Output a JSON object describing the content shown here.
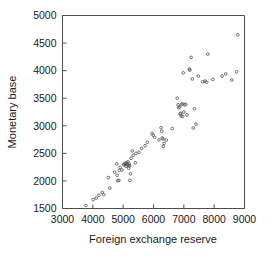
{
  "chart_data": {
    "type": "scatter",
    "title": "",
    "xlabel": "Foreign exchange reserve",
    "ylabel": "Monetary base",
    "xlim": [
      3000,
      9000
    ],
    "ylim": [
      1500,
      5000
    ],
    "xticks": [
      3000,
      4000,
      5000,
      6000,
      7000,
      8000,
      9000
    ],
    "yticks": [
      1500,
      2000,
      2500,
      3000,
      3500,
      4000,
      4500,
      5000
    ],
    "xtick_labels": [
      "3000",
      "4000",
      "5000",
      "6000",
      "7000",
      "8000",
      "9000"
    ],
    "ytick_labels": [
      "1500",
      "2000",
      "2500",
      "3000",
      "3500",
      "4000",
      "4500",
      "5000"
    ],
    "grid": false,
    "legend": null,
    "marker": "open-circle",
    "marker_color": "#5a5a5a",
    "series": [
      {
        "name": "observations",
        "points": [
          [
            3770,
            1555
          ],
          [
            4010,
            1660
          ],
          [
            4110,
            1690
          ],
          [
            4200,
            1740
          ],
          [
            4310,
            1790
          ],
          [
            4360,
            1750
          ],
          [
            4510,
            2060
          ],
          [
            4560,
            1870
          ],
          [
            4720,
            2160
          ],
          [
            4790,
            2310
          ],
          [
            4800,
            2100
          ],
          [
            4820,
            2005
          ],
          [
            4860,
            2010
          ],
          [
            4870,
            2190
          ],
          [
            4900,
            2245
          ],
          [
            4960,
            2200
          ],
          [
            5010,
            2300
          ],
          [
            5040,
            2290
          ],
          [
            5060,
            2320
          ],
          [
            5080,
            2300
          ],
          [
            5090,
            2265
          ],
          [
            5110,
            2330
          ],
          [
            5130,
            2310
          ],
          [
            5150,
            2295
          ],
          [
            5160,
            2345
          ],
          [
            5170,
            2280
          ],
          [
            5180,
            2230
          ],
          [
            5200,
            2305
          ],
          [
            5210,
            2270
          ],
          [
            5220,
            2010
          ],
          [
            5240,
            2130
          ],
          [
            5260,
            2410
          ],
          [
            5300,
            2545
          ],
          [
            5330,
            2465
          ],
          [
            5400,
            2330
          ],
          [
            5420,
            2500
          ],
          [
            5520,
            2520
          ],
          [
            5610,
            2590
          ],
          [
            5720,
            2640
          ],
          [
            5800,
            2700
          ],
          [
            5950,
            2860
          ],
          [
            5990,
            2830
          ],
          [
            6040,
            2790
          ],
          [
            6180,
            2745
          ],
          [
            6250,
            2965
          ],
          [
            6270,
            2900
          ],
          [
            6290,
            2780
          ],
          [
            6310,
            2760
          ],
          [
            6320,
            2625
          ],
          [
            6350,
            2680
          ],
          [
            6420,
            2740
          ],
          [
            6620,
            2950
          ],
          [
            6780,
            3500
          ],
          [
            6810,
            3380
          ],
          [
            6830,
            3330
          ],
          [
            6860,
            3340
          ],
          [
            6880,
            3215
          ],
          [
            6900,
            3225
          ],
          [
            6910,
            3180
          ],
          [
            6930,
            3385
          ],
          [
            6950,
            3400
          ],
          [
            6960,
            3170
          ],
          [
            6980,
            3960
          ],
          [
            7000,
            3250
          ],
          [
            7030,
            3380
          ],
          [
            7060,
            3390
          ],
          [
            7100,
            3200
          ],
          [
            7180,
            4030
          ],
          [
            7200,
            4010
          ],
          [
            7240,
            4240
          ],
          [
            7280,
            3850
          ],
          [
            7310,
            2960
          ],
          [
            7350,
            3310
          ],
          [
            7400,
            3030
          ],
          [
            7480,
            3900
          ],
          [
            7620,
            3800
          ],
          [
            7700,
            3810
          ],
          [
            7750,
            3790
          ],
          [
            7790,
            4300
          ],
          [
            7960,
            3840
          ],
          [
            8260,
            3900
          ],
          [
            8380,
            3940
          ],
          [
            8580,
            3830
          ],
          [
            8740,
            3980
          ],
          [
            8780,
            4650
          ]
        ]
      }
    ]
  },
  "axes": {
    "x_axis_name": "x-axis",
    "y_axis_name": "y-axis"
  }
}
